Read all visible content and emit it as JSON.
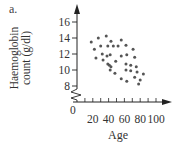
{
  "panel_label": "a.",
  "chart_data": {
    "type": "scatter",
    "title": "",
    "xlabel": "Age",
    "ylabel": "Haemoglobin count (g/dl)",
    "ylabel_lines": [
      "Haemoglobin",
      "count (g/dl)"
    ],
    "x_ticks": [
      20,
      40,
      60,
      80,
      100
    ],
    "y_ticks": [
      8,
      10,
      12,
      14,
      16
    ],
    "origin_label": "0",
    "xlim": [
      0,
      100
    ],
    "ylim": [
      8,
      16
    ],
    "y_axis_break": true,
    "grid": false,
    "legend": null,
    "points": [
      {
        "x": 18,
        "y": 13.5
      },
      {
        "x": 27,
        "y": 14.0
      },
      {
        "x": 37,
        "y": 14.25
      },
      {
        "x": 43,
        "y": 13.6
      },
      {
        "x": 56,
        "y": 13.75
      },
      {
        "x": 22,
        "y": 12.6
      },
      {
        "x": 30,
        "y": 13.0
      },
      {
        "x": 39,
        "y": 13.0
      },
      {
        "x": 46,
        "y": 13.0
      },
      {
        "x": 52,
        "y": 13.0
      },
      {
        "x": 62,
        "y": 13.1
      },
      {
        "x": 71,
        "y": 12.6
      },
      {
        "x": 32,
        "y": 12.0
      },
      {
        "x": 38,
        "y": 11.75
      },
      {
        "x": 42,
        "y": 11.9
      },
      {
        "x": 24,
        "y": 11.5
      },
      {
        "x": 33,
        "y": 11.25
      },
      {
        "x": 56,
        "y": 11.75
      },
      {
        "x": 63,
        "y": 11.9
      },
      {
        "x": 73,
        "y": 11.6
      },
      {
        "x": 49,
        "y": 11.1
      },
      {
        "x": 39,
        "y": 10.75
      },
      {
        "x": 43,
        "y": 10.4
      },
      {
        "x": 41,
        "y": 10.6
      },
      {
        "x": 62,
        "y": 10.75
      },
      {
        "x": 68,
        "y": 10.6
      },
      {
        "x": 75,
        "y": 10.4
      },
      {
        "x": 62,
        "y": 10.0
      },
      {
        "x": 68,
        "y": 9.9
      },
      {
        "x": 76,
        "y": 9.75
      },
      {
        "x": 42,
        "y": 10.0
      },
      {
        "x": 84,
        "y": 9.5
      },
      {
        "x": 48,
        "y": 9.6
      },
      {
        "x": 56,
        "y": 8.9
      },
      {
        "x": 63,
        "y": 8.6
      },
      {
        "x": 73,
        "y": 9.1
      },
      {
        "x": 80,
        "y": 8.75
      },
      {
        "x": 78,
        "y": 8.25
      }
    ],
    "colors": {
      "points": "#555555",
      "axes": "#222222",
      "text": "#333333"
    }
  }
}
